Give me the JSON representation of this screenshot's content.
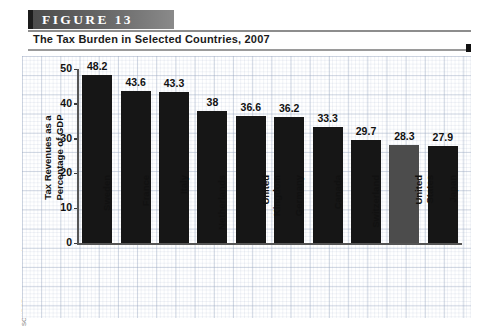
{
  "figure": {
    "banner_label": "FIGURE  13",
    "subtitle": "The Tax Burden in Selected Countries, 2007",
    "source": "SOURCE: www.stats.oecd.org"
  },
  "colors": {
    "bar_default": "#161616",
    "bar_highlight": "#4c4c4c",
    "banner_dark": "#4a4a4a",
    "banner_light": "#8a8a8a",
    "axis": "#555555",
    "text": "#111111"
  },
  "chart_data": {
    "type": "bar",
    "title": "The Tax Burden in Selected Countries, 2007",
    "xlabel": "",
    "ylabel": "Tax Revenues as a Percentage of GDP",
    "ylabel_line1": "Tax Revenues as a",
    "ylabel_line2": "Percentage of GDP",
    "ylim": [
      0,
      50
    ],
    "yticks": [
      0,
      10,
      20,
      30,
      40,
      50
    ],
    "ytick_labels": [
      "0",
      "10",
      "20",
      "30",
      "40",
      "50"
    ],
    "grid": true,
    "legend": "none",
    "highlight_category": "United States",
    "categories": [
      "Sweden",
      "France",
      "Italy",
      "Netherlands",
      "United Kingdom",
      "Germany",
      "Canada",
      "Switzerland",
      "United States",
      "Japan"
    ],
    "category_lines": [
      [
        "Sweden"
      ],
      [
        "France"
      ],
      [
        "Italy"
      ],
      [
        "Netherlands"
      ],
      [
        "United",
        "Kingdom"
      ],
      [
        "Germany"
      ],
      [
        "Canada"
      ],
      [
        "Switzerland"
      ],
      [
        "United",
        "States"
      ],
      [
        "Japan"
      ]
    ],
    "values": [
      48.2,
      43.6,
      43.3,
      38,
      36.6,
      36.2,
      33.3,
      29.7,
      28.3,
      27.9
    ],
    "value_labels": [
      "48.2",
      "43.6",
      "43.3",
      "38",
      "36.6",
      "36.2",
      "33.3",
      "29.7",
      "28.3",
      "27.9"
    ]
  }
}
